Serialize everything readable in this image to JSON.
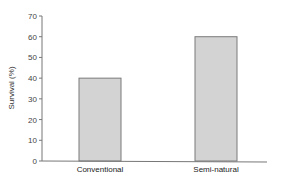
{
  "chart_data": {
    "type": "bar",
    "title": "",
    "xlabel": "",
    "ylabel": "Survival (%)",
    "categories": [
      "Conventional",
      "Semi-natural"
    ],
    "values": [
      40,
      60
    ],
    "ylim": [
      0,
      70
    ],
    "yticks": [
      0,
      10,
      20,
      30,
      40,
      50,
      60,
      70
    ],
    "grid": false,
    "legend": null,
    "colors": {
      "bar_fill": "#d3d3d3",
      "bar_stroke": "#7a7a7a",
      "axis": "#777777"
    }
  }
}
